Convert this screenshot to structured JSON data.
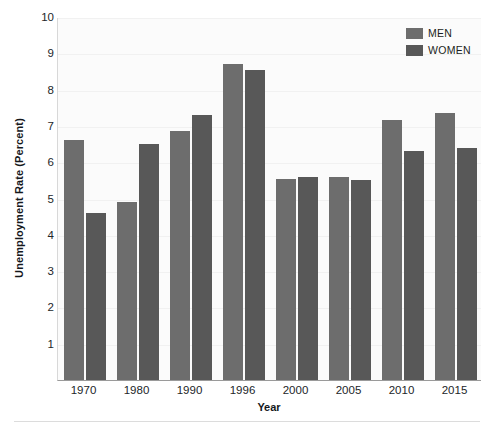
{
  "chart_data": {
    "type": "bar",
    "title": "",
    "xlabel": "Year",
    "ylabel": "Unemployment Rate (Percent)",
    "categories": [
      "1970",
      "1980",
      "1990",
      "1996",
      "2000",
      "2005",
      "2010",
      "2015"
    ],
    "series": [
      {
        "name": "MEN",
        "color": "#6d6d6d",
        "values": [
          6.6,
          4.9,
          6.85,
          8.7,
          5.55,
          5.6,
          7.15,
          7.35
        ]
      },
      {
        "name": "WOMEN",
        "color": "#585858",
        "values": [
          4.6,
          6.5,
          7.3,
          8.55,
          5.6,
          5.5,
          6.3,
          6.4
        ]
      }
    ],
    "ylim": [
      0,
      10
    ],
    "yticks": [
      1,
      2,
      3,
      4,
      5,
      6,
      7,
      8,
      9,
      10
    ],
    "ytick_labels": [
      "1",
      "2",
      "3",
      "4",
      "5",
      "6",
      "7",
      "8",
      "9",
      "10"
    ],
    "grid": true,
    "legend_position": "top-right"
  },
  "legend": {
    "entries": [
      {
        "label": "MEN",
        "color": "#6d6d6d"
      },
      {
        "label": "WOMEN",
        "color": "#585858"
      }
    ]
  }
}
